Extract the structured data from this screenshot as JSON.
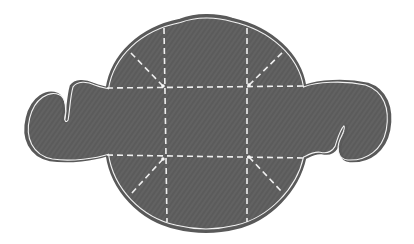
{
  "diagram": {
    "type": "pattern-piece",
    "colors": {
      "background": "#ffffff",
      "fill": "#616161",
      "outline": "#5a5a5a",
      "inner_line": "#f2f2f2",
      "dash": "#eeeeee"
    },
    "main_body": {
      "cx": 206,
      "cy": 122,
      "left": 107,
      "right": 305,
      "top": 16,
      "bottom": 232
    },
    "fold_lines": {
      "horizontal": [
        {
          "name": "upper",
          "x1": 107,
          "y1": 88,
          "x2": 305,
          "y2": 86
        },
        {
          "name": "lower",
          "x1": 107,
          "y1": 155,
          "x2": 305,
          "y2": 158
        }
      ],
      "vertical": [
        {
          "name": "left",
          "x1": 164,
          "y1": 28,
          "x2": 167,
          "y2": 222
        },
        {
          "name": "right",
          "x1": 247,
          "y1": 28,
          "x2": 247,
          "y2": 222
        }
      ],
      "diagonal": [
        {
          "name": "top-left",
          "x1": 163,
          "y1": 86,
          "x2": 129,
          "y2": 51
        },
        {
          "name": "top-right",
          "x1": 249,
          "y1": 85,
          "x2": 284,
          "y2": 51
        },
        {
          "name": "bottom-left",
          "x1": 163,
          "y1": 159,
          "x2": 131,
          "y2": 194
        },
        {
          "name": "bottom-right",
          "x1": 249,
          "y1": 157,
          "x2": 283,
          "y2": 193
        }
      ]
    },
    "ears": [
      {
        "side": "left",
        "extent_x": 25,
        "top_y": 82,
        "bottom_y": 162
      },
      {
        "side": "right",
        "extent_x": 390,
        "top_y": 82,
        "bottom_y": 163
      }
    ]
  }
}
